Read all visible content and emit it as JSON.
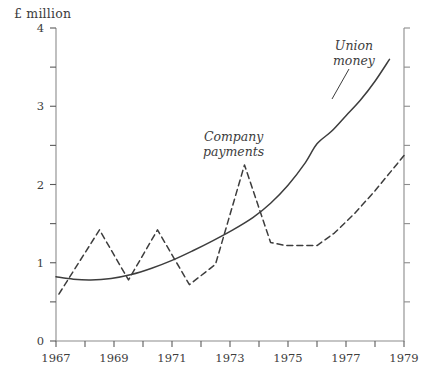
{
  "chart_data": {
    "type": "line",
    "title": "",
    "subtitle": "",
    "xlabel": "",
    "ylabel": "£ million",
    "unit_label": "£ million",
    "xlim": [
      1967,
      1979
    ],
    "ylim": [
      0,
      4
    ],
    "grid": false,
    "legend_position": "inline-annotations",
    "x_major_ticks": [
      1967,
      1969,
      1971,
      1973,
      1975,
      1977,
      1979
    ],
    "x_minor_ticks": [
      1968,
      1970,
      1972,
      1974,
      1976,
      1978
    ],
    "x_tick_labels": [
      "1967",
      "1969",
      "1971",
      "1973",
      "1975",
      "1977",
      "1979"
    ],
    "y_major_ticks": [
      0,
      1,
      2,
      3,
      4
    ],
    "y_minor_ticks": [
      0.5,
      1.5,
      2.5,
      3.5
    ],
    "y_tick_labels": [
      "0",
      "1",
      "2",
      "3",
      "4"
    ],
    "series": [
      {
        "name": "Union money",
        "label": "Union money",
        "label_line1": "Union",
        "label_line2": "money",
        "style": "solid",
        "color": "#3d3d3d",
        "points": [
          [
            1967.0,
            0.82
          ],
          [
            1967.6,
            0.79
          ],
          [
            1968.2,
            0.78
          ],
          [
            1968.9,
            0.8
          ],
          [
            1969.6,
            0.85
          ],
          [
            1970.3,
            0.93
          ],
          [
            1971.0,
            1.03
          ],
          [
            1971.7,
            1.15
          ],
          [
            1972.4,
            1.28
          ],
          [
            1973.1,
            1.42
          ],
          [
            1973.8,
            1.58
          ],
          [
            1974.4,
            1.76
          ],
          [
            1975.0,
            1.99
          ],
          [
            1975.6,
            2.28
          ],
          [
            1976.0,
            2.52
          ],
          [
            1976.5,
            2.68
          ],
          [
            1977.0,
            2.88
          ],
          [
            1977.5,
            3.08
          ],
          [
            1978.0,
            3.32
          ],
          [
            1978.5,
            3.6
          ]
        ]
      },
      {
        "name": "Company payments",
        "label": "Company payments",
        "label_line1": "Company",
        "label_line2": "payments",
        "style": "dashed",
        "color": "#3d3d3d",
        "points": [
          [
            1967.1,
            0.6
          ],
          [
            1968.5,
            1.42
          ],
          [
            1969.5,
            0.78
          ],
          [
            1970.5,
            1.42
          ],
          [
            1971.6,
            0.72
          ],
          [
            1972.5,
            0.98
          ],
          [
            1973.5,
            2.25
          ],
          [
            1974.4,
            1.26
          ],
          [
            1974.9,
            1.22
          ],
          [
            1976.0,
            1.22
          ],
          [
            1976.6,
            1.38
          ],
          [
            1977.3,
            1.63
          ],
          [
            1978.0,
            1.92
          ],
          [
            1979.0,
            2.37
          ]
        ]
      }
    ]
  },
  "annotations": {
    "unit": "£ million",
    "company": {
      "line1": "Company",
      "line2": "payments"
    },
    "union": {
      "line1": "Union",
      "line2": "money"
    }
  }
}
